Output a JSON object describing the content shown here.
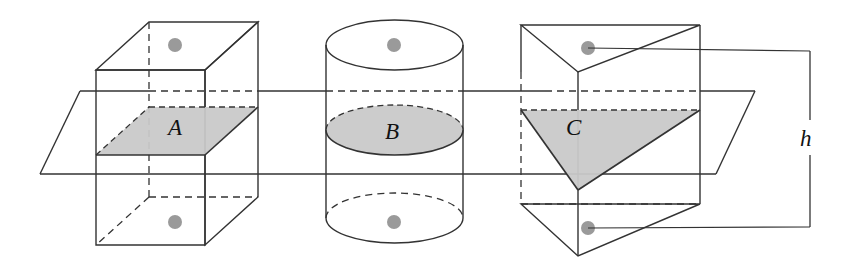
{
  "figure": {
    "background_color": "#ffffff",
    "stroke_color": "#333333",
    "fill_gray": "#c9c9c9",
    "dot_color": "#9a9a9a",
    "labels": {
      "cube_cross_section": "A",
      "cylinder_cross_section": "B",
      "prism_cross_section": "C",
      "height_measure": "h"
    },
    "solids": [
      {
        "name": "cube",
        "label": "A",
        "cross_section_shape": "parallelogram"
      },
      {
        "name": "cylinder",
        "label": "B",
        "cross_section_shape": "ellipse"
      },
      {
        "name": "triangular-prism",
        "label": "C",
        "cross_section_shape": "triangle"
      }
    ],
    "annotations": {
      "cutting_plane": "horizontal plane slicing all three solids",
      "height_bracket": "h"
    }
  }
}
